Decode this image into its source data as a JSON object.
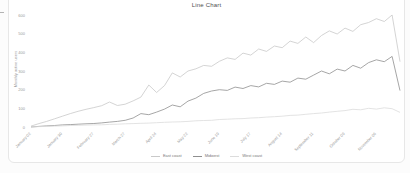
{
  "page": {
    "background_fragment": "text-fragment-dash"
  },
  "chart_data": {
    "type": "line",
    "title": "Line Chart",
    "ylabel": "Monthly active users",
    "xlabel": "",
    "ylim": [
      0,
      600
    ],
    "yticks": [
      0,
      100,
      200,
      300,
      400,
      500,
      600
    ],
    "grid": false,
    "legend_position": "bottom",
    "n_points": 48,
    "x_tick_indices": [
      0,
      4,
      8,
      12,
      16,
      20,
      24,
      28,
      32,
      36,
      40,
      44
    ],
    "x_tick_labels": [
      "January 02",
      "January 30",
      "February 27",
      "March 27",
      "April 24",
      "May 22",
      "June 19",
      "July 17",
      "August 14",
      "September 11",
      "October 09",
      "November 06"
    ],
    "series": [
      {
        "name": "East coast",
        "color": "#c9c9c9",
        "values": [
          5,
          18,
          30,
          44,
          58,
          72,
          84,
          95,
          104,
          114,
          134,
          115,
          122,
          140,
          160,
          225,
          185,
          222,
          290,
          268,
          300,
          312,
          330,
          325,
          352,
          370,
          362,
          396,
          385,
          418,
          405,
          434,
          425,
          460,
          448,
          482,
          452,
          490,
          515,
          498,
          530,
          512,
          548,
          560,
          580,
          565,
          600,
          350
        ]
      },
      {
        "name": "Midwest",
        "color": "#8f8f8f",
        "values": [
          0,
          3,
          6,
          8,
          11,
          13,
          15,
          17,
          19,
          22,
          26,
          30,
          36,
          48,
          72,
          66,
          80,
          96,
          118,
          108,
          139,
          155,
          180,
          193,
          200,
          196,
          214,
          206,
          222,
          215,
          234,
          228,
          246,
          240,
          262,
          256,
          278,
          300,
          285,
          310,
          300,
          330,
          315,
          345,
          360,
          350,
          378,
          195
        ]
      },
      {
        "name": "West coast",
        "color": "#dcdcdc",
        "values": [
          0,
          2,
          3,
          5,
          6,
          8,
          9,
          10,
          11,
          12,
          14,
          15,
          17,
          18,
          20,
          21,
          23,
          25,
          27,
          28,
          30,
          33,
          35,
          36,
          40,
          42,
          44,
          45,
          48,
          50,
          53,
          55,
          58,
          62,
          64,
          68,
          72,
          75,
          80,
          84,
          88,
          95,
          92,
          100,
          96,
          103,
          98,
          78
        ]
      }
    ]
  }
}
